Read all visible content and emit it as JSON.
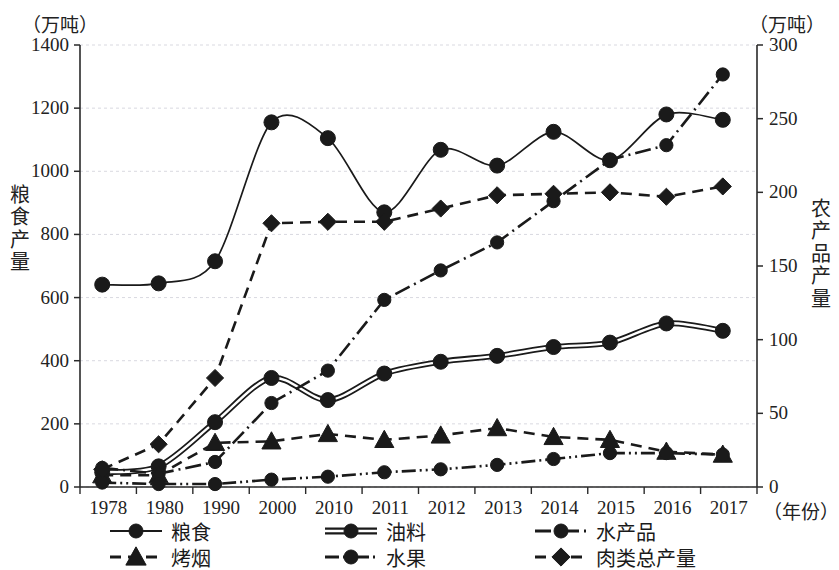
{
  "units": {
    "left": "（万吨）",
    "right": "（万吨）",
    "xaxis": "（年份）"
  },
  "axis_titles": {
    "left": "粮食产量",
    "right": "农产品产量"
  },
  "chart_data": {
    "type": "line",
    "title": "",
    "xlabel": "（年份）",
    "ylabel": "粮食产量",
    "y2label": "农产品产量",
    "ylim": [
      0,
      1400
    ],
    "y2lim": [
      0,
      300
    ],
    "ytick_step": 200,
    "y2tick_step": 50,
    "grid": true,
    "legend_position": "bottom",
    "categories": [
      "1978",
      "1980",
      "1990",
      "2000",
      "2010",
      "2011",
      "2012",
      "2013",
      "2014",
      "2015",
      "2016",
      "2017"
    ],
    "yticks": [
      "0",
      "200",
      "400",
      "600",
      "800",
      "1000",
      "1200",
      "1400"
    ],
    "y2ticks": [
      "0",
      "50",
      "100",
      "150",
      "200",
      "250",
      "300"
    ],
    "series": [
      {
        "name": "粮食",
        "axis": "left",
        "marker": "circle",
        "line_style": "solid",
        "values": [
          641,
          645,
          715,
          1155,
          1105,
          870,
          1068,
          1018,
          1125,
          1035,
          1180,
          1163
        ]
      },
      {
        "name": "油料",
        "axis": "right",
        "marker": "circle",
        "line_style": "double",
        "values": [
          10,
          14,
          44,
          74,
          59,
          77,
          85,
          89,
          95,
          98,
          111,
          106
        ]
      },
      {
        "name": "水产品",
        "axis": "right",
        "marker": "circle",
        "line_style": "dashdot",
        "values": [
          13,
          9,
          17,
          57,
          79,
          127,
          147,
          166,
          194,
          222,
          232,
          280
        ]
      },
      {
        "name": "烤烟",
        "axis": "right",
        "marker": "triangle",
        "line_style": "dashed",
        "values": [
          8,
          8,
          30,
          31,
          36,
          32,
          35,
          40,
          34,
          32,
          24,
          22
        ]
      },
      {
        "name": "水果",
        "axis": "right",
        "marker": "circle",
        "line_style": "dashdotdot",
        "values": [
          3,
          2,
          2,
          5,
          7,
          10,
          12,
          15,
          19,
          23,
          23,
          22
        ]
      },
      {
        "name": "肉类总产量",
        "axis": "right",
        "marker": "diamond",
        "line_style": "dashed",
        "values": [
          12,
          29,
          74,
          179,
          180,
          180,
          189,
          198,
          199,
          200,
          197,
          204
        ]
      }
    ]
  },
  "legend": {
    "items": [
      {
        "label": "粮食",
        "marker": "circle",
        "line_style": "solid"
      },
      {
        "label": "油料",
        "marker": "circle",
        "line_style": "double"
      },
      {
        "label": "水产品",
        "marker": "circle",
        "line_style": "dashdot"
      },
      {
        "label": "烤烟",
        "marker": "triangle",
        "line_style": "dashed"
      },
      {
        "label": "水果",
        "marker": "circle",
        "line_style": "dashdotdot"
      },
      {
        "label": "肉类总产量",
        "marker": "diamond",
        "line_style": "dashed"
      }
    ]
  },
  "colors": {
    "ink": "#1a1a1a",
    "grid": "#d9d9e0",
    "axis": "#2a2a2a",
    "background": "#ffffff"
  }
}
